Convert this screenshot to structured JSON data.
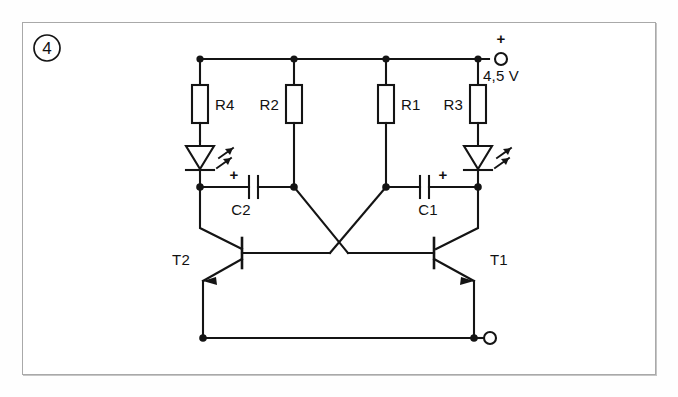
{
  "figure": {
    "badge_number": "4",
    "frame_color": "#a9a9a9",
    "ink_color": "#141414",
    "background_color": "#ffffff"
  },
  "power": {
    "plus_sign": "+",
    "voltage_label": "4,5 V"
  },
  "resistors": [
    {
      "id": "R4",
      "label": "R4",
      "label_side": "right"
    },
    {
      "id": "R2",
      "label": "R2",
      "label_side": "left"
    },
    {
      "id": "R1",
      "label": "R1",
      "label_side": "right"
    },
    {
      "id": "R3",
      "label": "R3",
      "label_side": "left"
    }
  ],
  "capacitors": [
    {
      "id": "C2",
      "label": "C2",
      "polarity_mark": "+",
      "polarity_side": "left"
    },
    {
      "id": "C1",
      "label": "C1",
      "polarity_mark": "+",
      "polarity_side": "right"
    }
  ],
  "transistors": [
    {
      "id": "T2",
      "label": "T2",
      "type": "npn",
      "orientation": "left"
    },
    {
      "id": "T1",
      "label": "T1",
      "type": "npn",
      "orientation": "right"
    }
  ],
  "leds": [
    {
      "id": "LED-left",
      "name": "light-emitting-diode"
    },
    {
      "id": "LED-right",
      "name": "light-emitting-diode"
    }
  ],
  "terminals": [
    {
      "id": "positive-terminal",
      "polarity": "+",
      "label": "4,5 V"
    },
    {
      "id": "negative-terminal",
      "polarity": "",
      "label": ""
    }
  ]
}
